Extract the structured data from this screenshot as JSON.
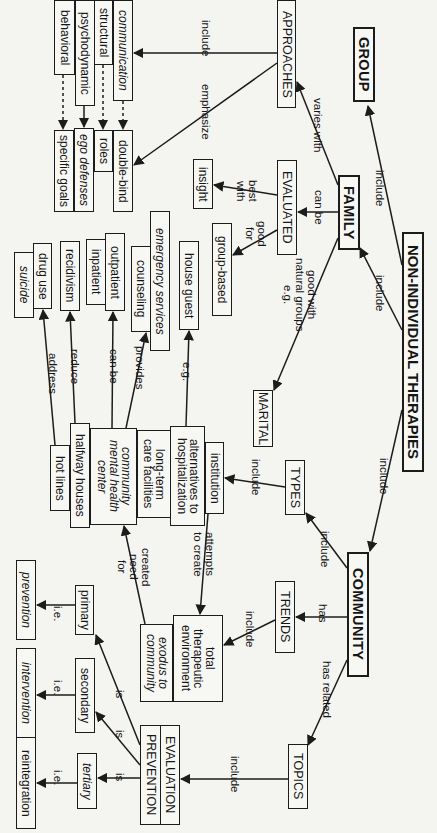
{
  "title": "NON-INDIVIDUAL THERAPIES",
  "nodes": {
    "root": "NON-INDIVIDUAL THERAPIES",
    "group": "GROUP",
    "family": "FAMILY",
    "community": "COMMUNITY",
    "approaches": "APPROACHES",
    "communication": "communication",
    "structural": "structural",
    "psychodynamic": "psychodynamic",
    "behavioral": "behavioral",
    "double_bind": "double-bind",
    "roles": "roles",
    "ego_defenses": "ego defenses",
    "specific_goals": "specific goals",
    "evaluated": "EVALUATED",
    "insight": "insight",
    "group_based": "group-based",
    "marital": "MARITAL",
    "types": "TYPES",
    "trends": "TRENDS",
    "topics": "TOPICS",
    "institution": "institution",
    "alternatives": "alternatives to\nhospitalization",
    "long_term": "long-term\ncare facilities",
    "cmhc": "community\nmental health\ncenter",
    "halfway": "halfway houses",
    "hotlines": "hot lines",
    "house_guest": "house guest",
    "emergency": "emergency services",
    "counseling": "counseling",
    "outpatient": "outpatient",
    "inpatient": "inpatient",
    "recidivism": "recidivism",
    "drug_use": "drug use",
    "suicide": "suicide",
    "total_env": "total\ntherapeutic\nenvironment",
    "exodus": "exodus to\ncommunity",
    "evaluation": "EVALUATION",
    "prevention_cap": "PREVENTION",
    "primary": "primary",
    "secondary": "secondary",
    "tertiary": "tertiary",
    "prevention": "prevention",
    "intervention": "intervention",
    "reintegration": "reintegration"
  },
  "links": {
    "include_group": "include",
    "include_family": "include",
    "include_community": "include",
    "varies_with": "varies with",
    "approaches_include": "include",
    "emphasize": "emphasize",
    "can_be": "can be",
    "best_with": "best\nwith",
    "good_for": "good\nfor",
    "natural_groups": "good with\nnatural groups\ne.g.",
    "types_include": "include",
    "institution_include": "include",
    "eg_house": "e.g.",
    "provides": "provides",
    "can_be_2": "can be",
    "reduce": "reduce",
    "address": "address",
    "attempts": "attempts\nto create",
    "created_need": "created\nneed\nfor",
    "has": "has",
    "trends_include": "include",
    "has_related": "has related",
    "topics_include": "include",
    "is_1": "is",
    "is_2": "is",
    "is_3": "is",
    "ie_1": "i.e.",
    "ie_2": "i.e.",
    "ie_3": "i.e."
  }
}
